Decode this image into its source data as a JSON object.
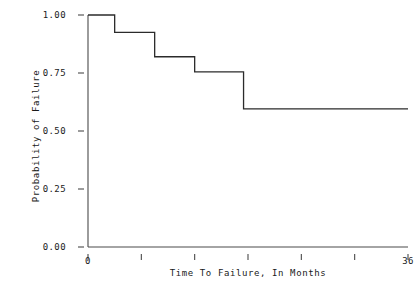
{
  "chart_data": {
    "type": "line",
    "title": "",
    "xlabel": "Time To Failure, In Months",
    "ylabel": "Probability of Failure",
    "xlim": [
      0,
      36
    ],
    "ylim": [
      0.0,
      1.0
    ],
    "grid": false,
    "legend": null,
    "step": "post",
    "xticks": [
      0,
      6,
      12,
      18,
      24,
      30,
      36
    ],
    "xtick_labels": [
      "0",
      "",
      "",
      "",
      "",
      "",
      "36"
    ],
    "yticks": [
      0.0,
      0.25,
      0.5,
      0.75,
      1.0
    ],
    "ytick_labels": [
      "0.00",
      "0.25",
      "0.50",
      "0.75",
      "1.00"
    ],
    "x": [
      0,
      3.0,
      7.5,
      12.0,
      17.5,
      36
    ],
    "y": [
      1.0,
      0.925,
      0.82,
      0.755,
      0.595,
      0.595
    ],
    "series": [
      {
        "name": "Probability of Failure",
        "points": [
          {
            "x": 0,
            "y": 1.0
          },
          {
            "x": 3.0,
            "y": 0.925
          },
          {
            "x": 7.5,
            "y": 0.82
          },
          {
            "x": 12.0,
            "y": 0.755
          },
          {
            "x": 17.5,
            "y": 0.595
          },
          {
            "x": 36,
            "y": 0.595
          }
        ]
      }
    ],
    "line_color": "#2b2b2b"
  }
}
